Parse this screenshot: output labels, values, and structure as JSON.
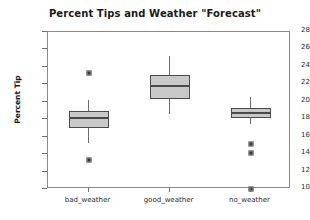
{
  "chart_data": {
    "type": "box",
    "title": "Percent Tips and Weather \"Forecast\"",
    "xlabel": "",
    "ylabel": "Percent Tip",
    "categories": [
      "bad_weather",
      "good_weather",
      "no_weather"
    ],
    "ylim": [
      10,
      28
    ],
    "ytick_labels": [
      "28",
      "26",
      "24",
      "22",
      "20",
      "18",
      "16",
      "14",
      "12",
      "10"
    ],
    "ytick_values": [
      28,
      26,
      24,
      22,
      20,
      18,
      16,
      14,
      12,
      10
    ],
    "grid": false,
    "legend": "none",
    "boxes": [
      {
        "category": "bad_weather",
        "whisker_low": 15.3,
        "q1": 17.0,
        "median": 18.1,
        "q3": 18.9,
        "whisker_high": 20.2,
        "outliers": [
          23.3,
          13.3
        ]
      },
      {
        "category": "good_weather",
        "whisker_low": 18.6,
        "q1": 20.3,
        "median": 21.8,
        "q3": 23.1,
        "whisker_high": 25.3,
        "outliers": []
      },
      {
        "category": "no_weather",
        "whisker_low": 17.4,
        "q1": 18.1,
        "median": 18.7,
        "q3": 19.3,
        "whisker_high": 20.6,
        "outliers": [
          15.2,
          14.1,
          10.0
        ]
      }
    ]
  },
  "style": {
    "box_fill": "#c9c9c9",
    "box_edge": "#4a4a4a",
    "frame_color": "#8a8a8a",
    "text_color": "#1a1a1a",
    "background": "#ffffff"
  }
}
